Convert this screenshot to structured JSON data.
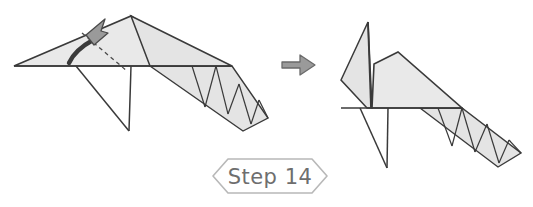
{
  "document": {
    "type": "origami-instruction-diagram",
    "background_color": "#ffffff"
  },
  "step_banner": {
    "label": "Step 14",
    "shape": "hexagon",
    "outline_color": "#b8b8b8",
    "text_color": "#6e6e6e"
  },
  "transition": {
    "icon": "right-arrow-icon",
    "fill_color": "#9a9a9a",
    "outline_color": "#6a6a6a"
  },
  "figures": [
    {
      "id": "before",
      "label": "before-fold",
      "position": "left",
      "paper_fill": "#e9e9e9",
      "outline_color": "#3a3a3a",
      "parts": [
        "body-triangle",
        "head-flap",
        "tail-strip-zigzag",
        "legs"
      ],
      "fold_line": {
        "style": "dashed",
        "color": "#4a4a4a"
      },
      "action_arrow": {
        "icon": "curved-fold-arrow-icon",
        "direction": "up-right",
        "fill_color": "#9a9a9a",
        "outline_color": "#4a4a4a"
      },
      "zigzag_segments": 4
    },
    {
      "id": "after",
      "label": "after-fold",
      "position": "right",
      "paper_fill": "#e9e9e9",
      "outline_color": "#3a3a3a",
      "parts": [
        "body-triangle",
        "head-raised",
        "tail-strip-zigzag",
        "legs"
      ],
      "zigzag_segments": 4
    }
  ],
  "colors": {
    "paper": "#e9e9e9",
    "paper_shadow": "#dedede",
    "ink": "#3a3a3a",
    "arrow_gray": "#9a9a9a",
    "banner_gray": "#b8b8b8"
  }
}
